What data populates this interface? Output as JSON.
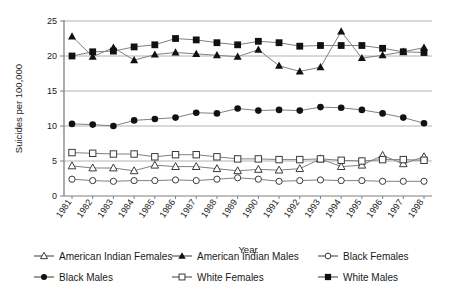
{
  "chart_data": {
    "type": "line",
    "title": "",
    "xlabel": "Year",
    "ylabel": "Suicides per 100,000",
    "ylim": [
      0,
      25
    ],
    "yticks": [
      0,
      5,
      10,
      15,
      20,
      25
    ],
    "grid": true,
    "legend_position": "bottom",
    "x": [
      1981,
      1982,
      1983,
      1984,
      1985,
      1986,
      1987,
      1988,
      1989,
      1990,
      1991,
      1992,
      1993,
      1994,
      1995,
      1996,
      1997,
      1998
    ],
    "categories": [
      "1981",
      "1982",
      "1983",
      "1984",
      "1985",
      "1986",
      "1987",
      "1988",
      "1989",
      "1990",
      "1991",
      "1992",
      "1993",
      "1994",
      "1995",
      "1996",
      "1997",
      "1998"
    ],
    "series": [
      {
        "name": "American Indian Females",
        "marker": "open-triangle",
        "values": [
          4.3,
          4.0,
          4.0,
          3.6,
          4.4,
          4.2,
          4.2,
          3.9,
          3.6,
          3.8,
          3.7,
          3.9,
          5.3,
          4.2,
          4.4,
          5.8,
          4.6,
          5.6
        ]
      },
      {
        "name": "American Indian Males",
        "marker": "filled-triangle",
        "values": [
          22.8,
          19.9,
          21.2,
          19.4,
          20.2,
          20.5,
          20.3,
          20.1,
          19.9,
          20.9,
          18.6,
          17.8,
          18.4,
          23.5,
          19.7,
          20.1,
          20.6,
          21.2
        ]
      },
      {
        "name": "Black Females",
        "marker": "open-circle",
        "values": [
          2.4,
          2.2,
          2.1,
          2.2,
          2.2,
          2.3,
          2.2,
          2.4,
          2.6,
          2.4,
          2.1,
          2.2,
          2.3,
          2.2,
          2.2,
          2.1,
          2.1,
          2.1
        ]
      },
      {
        "name": "Black Males",
        "marker": "filled-circle",
        "values": [
          10.3,
          10.2,
          10.0,
          10.8,
          11.0,
          11.2,
          11.9,
          11.8,
          12.5,
          12.2,
          12.3,
          12.2,
          12.7,
          12.6,
          12.3,
          11.8,
          11.2,
          10.4
        ]
      },
      {
        "name": "White Females",
        "marker": "open-square",
        "values": [
          6.2,
          6.1,
          6.0,
          6.0,
          5.6,
          5.9,
          5.9,
          5.6,
          5.3,
          5.3,
          5.2,
          5.2,
          5.3,
          5.1,
          5.0,
          5.2,
          5.2,
          5.1
        ]
      },
      {
        "name": "White Males",
        "marker": "filled-square",
        "values": [
          20.0,
          20.6,
          20.7,
          21.3,
          21.6,
          22.5,
          22.3,
          21.9,
          21.6,
          22.1,
          21.9,
          21.4,
          21.5,
          21.5,
          21.5,
          21.1,
          20.6,
          20.5
        ]
      }
    ]
  },
  "colors": {
    "line": "#808080",
    "marker": "#111111",
    "axis": "#808080",
    "grid": "#a9a9a9",
    "text": "#1a1a1a",
    "background": "#ffffff"
  },
  "legend": {
    "entries": [
      "American Indian Females",
      "American Indian Males",
      "Black Females",
      "Black Males",
      "White Females",
      "White Males"
    ]
  }
}
